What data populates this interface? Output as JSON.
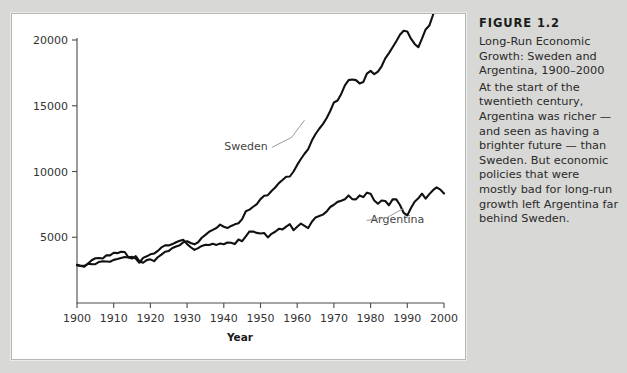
{
  "caption": {
    "heading": "FIGURE 1.2",
    "title": "Long-Run Economic Growth: Sweden and Argentina, 1900–2000",
    "body": "At the start of the twentieth century, Argentina was richer — and seen as having a brighter future — than Sweden. But economic policies that were mostly bad for long-run growth left Argentina far behind Sweden."
  },
  "colors": {
    "page_background": "#d8d8d6",
    "panel_background": "#ffffff",
    "line": "#111111",
    "axis": "#4a4a4a",
    "leader": "#9a9a9a",
    "text": "#2a2a2a"
  },
  "chart_data": {
    "type": "line",
    "title": "",
    "xlabel": "Year",
    "ylabel": "",
    "xlim": [
      1900,
      2000
    ],
    "ylim": [
      0,
      20000
    ],
    "xticks": [
      1900,
      1910,
      1920,
      1930,
      1940,
      1950,
      1960,
      1970,
      1980,
      1990,
      2000
    ],
    "xticklabels": [
      "1900",
      "1910",
      "1920",
      "1930",
      "1940",
      "1950",
      "1960",
      "1970",
      "1980",
      "1990",
      "2000"
    ],
    "yticks": [
      5000,
      10000,
      15000,
      20000
    ],
    "yticklabels": [
      "5000",
      "10000",
      "15000",
      "20000"
    ],
    "grid": false,
    "legend": "inline-annotations",
    "annotations": [
      {
        "text": "Sweden",
        "x": 1952,
        "y": 11600
      },
      {
        "text": "Argentina",
        "x": 1980,
        "y": 6050
      }
    ],
    "x": [
      1900,
      1901,
      1902,
      1903,
      1904,
      1905,
      1906,
      1907,
      1908,
      1909,
      1910,
      1911,
      1912,
      1913,
      1914,
      1915,
      1916,
      1917,
      1918,
      1919,
      1920,
      1921,
      1922,
      1923,
      1924,
      1925,
      1926,
      1927,
      1928,
      1929,
      1930,
      1931,
      1932,
      1933,
      1934,
      1935,
      1936,
      1937,
      1938,
      1939,
      1940,
      1941,
      1942,
      1943,
      1944,
      1945,
      1946,
      1947,
      1948,
      1949,
      1950,
      1951,
      1952,
      1953,
      1954,
      1955,
      1956,
      1957,
      1958,
      1959,
      1960,
      1961,
      1962,
      1963,
      1964,
      1965,
      1966,
      1967,
      1968,
      1969,
      1970,
      1971,
      1972,
      1973,
      1974,
      1975,
      1976,
      1977,
      1978,
      1979,
      1980,
      1981,
      1982,
      1983,
      1984,
      1985,
      1986,
      1987,
      1988,
      1989,
      1990,
      1991,
      1992,
      1993,
      1994,
      1995,
      1996,
      1997,
      1998,
      1999,
      2000
    ],
    "series": [
      {
        "name": "Sweden",
        "values": [
          2900,
          2830,
          2820,
          2980,
          2960,
          2950,
          3120,
          3180,
          3160,
          3140,
          3280,
          3340,
          3420,
          3500,
          3460,
          3380,
          3560,
          3180,
          3060,
          3260,
          3320,
          3180,
          3480,
          3680,
          3900,
          3960,
          4180,
          4300,
          4400,
          4620,
          4700,
          4560,
          4460,
          4620,
          4960,
          5180,
          5420,
          5560,
          5700,
          5960,
          5800,
          5700,
          5860,
          5980,
          6060,
          6380,
          6980,
          7100,
          7320,
          7520,
          7900,
          8150,
          8200,
          8520,
          8780,
          9120,
          9350,
          9600,
          9620,
          10000,
          10500,
          10950,
          11350,
          11700,
          12350,
          12850,
          13250,
          13600,
          14050,
          14600,
          15250,
          15400,
          15900,
          16550,
          16950,
          17000,
          16950,
          16700,
          16800,
          17450,
          17650,
          17400,
          17600,
          18000,
          18600,
          19000,
          19450,
          19900,
          20400,
          20700,
          20650,
          20100,
          19700,
          19450,
          20100,
          20800,
          21100,
          21900,
          22700,
          23400,
          24100
        ]
      },
      {
        "name": "Argentina",
        "values": [
          2880,
          2820,
          2760,
          3000,
          3250,
          3400,
          3420,
          3380,
          3620,
          3620,
          3820,
          3790,
          3900,
          3880,
          3480,
          3510,
          3380,
          3060,
          3430,
          3550,
          3700,
          3760,
          3960,
          4230,
          4380,
          4380,
          4480,
          4620,
          4740,
          4800,
          4480,
          4240,
          4040,
          4170,
          4340,
          4430,
          4410,
          4510,
          4420,
          4520,
          4470,
          4600,
          4580,
          4480,
          4830,
          4700,
          5060,
          5440,
          5430,
          5330,
          5290,
          5320,
          4990,
          5260,
          5420,
          5640,
          5600,
          5810,
          5990,
          5540,
          5800,
          6040,
          5870,
          5700,
          6180,
          6510,
          6610,
          6720,
          6950,
          7300,
          7470,
          7690,
          7770,
          7890,
          8180,
          7900,
          7880,
          8180,
          8050,
          8390,
          8310,
          7800,
          7550,
          7790,
          7760,
          7430,
          7880,
          7880,
          7450,
          6860,
          6660,
          7220,
          7700,
          7960,
          8310,
          7930,
          8280,
          8580,
          8790,
          8620,
          8320
        ]
      }
    ]
  }
}
